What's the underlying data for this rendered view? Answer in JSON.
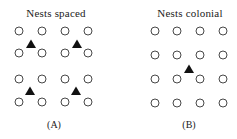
{
  "panels": [
    {
      "title": "Nests spaced",
      "label": "(A)",
      "title_x": 56,
      "label_x": 54,
      "nests": {
        "cols": [
          19,
          42,
          65,
          88
        ],
        "rows": [
          31,
          53,
          79,
          102
        ]
      },
      "birds": [
        [
          31,
          44
        ],
        [
          77,
          44
        ],
        [
          30,
          91
        ],
        [
          76,
          91
        ]
      ]
    },
    {
      "title": "Nests colonial",
      "label": "(B)",
      "title_x": 190,
      "label_x": 189,
      "nests": {
        "cols": [
          155,
          177,
          200,
          223
        ],
        "rows": [
          31,
          55,
          79,
          103
        ]
      },
      "birds": [
        [
          189,
          69
        ]
      ]
    }
  ],
  "legend_semantics": {
    "circle": "nest",
    "triangle": "predator/bird"
  }
}
